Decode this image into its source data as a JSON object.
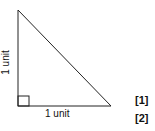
{
  "diagram": {
    "shape": "right triangle",
    "vertices": {
      "top": [
        18,
        10
      ],
      "bottom_left": [
        18,
        106
      ],
      "bottom_right": [
        111,
        106
      ]
    },
    "right_angle_marker": true,
    "labels": {
      "vertical_side": "1 unit",
      "horizontal_side": "1 unit"
    },
    "marks": [
      "[1]",
      "[2]"
    ]
  }
}
